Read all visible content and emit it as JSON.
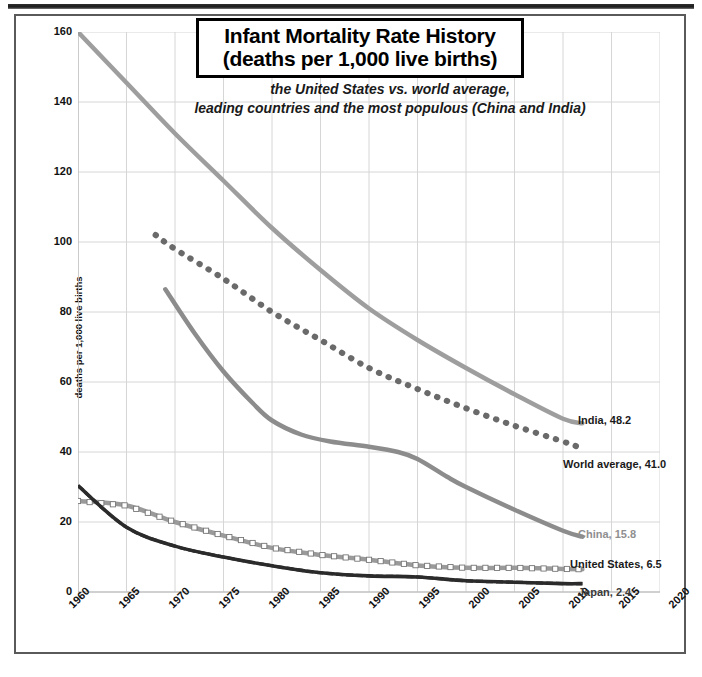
{
  "title": {
    "line1": "Infant Mortality Rate History",
    "line2": "(deaths per 1,000 live births)"
  },
  "subtitle": {
    "line1": "the United States vs. world average,",
    "line2": "leading countries and the most populous (China and India)"
  },
  "chart_data": {
    "type": "line",
    "title": "Infant Mortality Rate History (deaths per 1,000 live births)",
    "subtitle": "the United States vs. world average, leading countries and the most populous (China and India)",
    "xlabel": "",
    "ylabel": "deaths per 1,000 live births",
    "xlim": [
      1960,
      2020
    ],
    "ylim": [
      0,
      160
    ],
    "xticks": [
      1960,
      1965,
      1970,
      1975,
      1980,
      1985,
      1990,
      1995,
      2000,
      2005,
      2010,
      2015,
      2020
    ],
    "yticks": [
      0,
      20,
      40,
      60,
      80,
      100,
      120,
      140,
      160
    ],
    "grid": true,
    "legend_position": "end-of-line labels on right",
    "series": [
      {
        "name": "India",
        "end_label": "India, 48.2",
        "final_value": 48.2,
        "color": "#9e9e9e",
        "style": "solid-thick",
        "x": [
          1960,
          1965,
          1970,
          1975,
          1980,
          1985,
          1990,
          1995,
          2000,
          2005,
          2010,
          2012
        ],
        "values": [
          160.0,
          145.5,
          131.0,
          117.5,
          104.0,
          92.0,
          81.0,
          72.0,
          64.0,
          56.5,
          49.5,
          48.2
        ]
      },
      {
        "name": "World average",
        "end_label": "World average, 41.0",
        "final_value": 41.0,
        "color": "#6a6a6a",
        "style": "dotted",
        "x": [
          1968,
          1970,
          1975,
          1980,
          1985,
          1990,
          1995,
          2000,
          2005,
          2010,
          2012
        ],
        "values": [
          102.0,
          98.0,
          89.5,
          80.0,
          72.0,
          64.0,
          58.0,
          52.5,
          47.5,
          43.0,
          41.0
        ]
      },
      {
        "name": "China",
        "end_label": "China, 15.8",
        "final_value": 15.8,
        "color": "#8c8c8c",
        "style": "solid-thick",
        "x": [
          1969,
          1972,
          1975,
          1978,
          1980,
          1983,
          1986,
          1990,
          1993,
          1995,
          1998,
          2000,
          2005,
          2010,
          2012
        ],
        "values": [
          86.5,
          74.0,
          63.0,
          54.0,
          49.0,
          45.0,
          43.0,
          41.5,
          40.0,
          38.0,
          33.0,
          30.0,
          23.5,
          17.5,
          15.8
        ]
      },
      {
        "name": "United States",
        "end_label": "United States, 6.5",
        "final_value": 6.5,
        "color": "#9a9a9a",
        "style": "solid-marker-square",
        "x": [
          1960,
          1965,
          1970,
          1975,
          1980,
          1985,
          1990,
          1995,
          2000,
          2005,
          2010,
          2012
        ],
        "values": [
          26.0,
          24.7,
          20.0,
          16.1,
          12.6,
          10.6,
          9.2,
          7.6,
          6.9,
          6.9,
          6.6,
          6.5
        ]
      },
      {
        "name": "Japan",
        "end_label": "Japan, 2.4",
        "final_value": 2.4,
        "color": "#2b2b2b",
        "style": "dashed",
        "x": [
          1960,
          1965,
          1970,
          1975,
          1980,
          1985,
          1990,
          1995,
          2000,
          2005,
          2010,
          2012
        ],
        "values": [
          30.4,
          18.5,
          13.1,
          10.0,
          7.5,
          5.5,
          4.6,
          4.3,
          3.2,
          2.8,
          2.4,
          2.4
        ]
      }
    ]
  },
  "yticks_text": [
    "160",
    "140",
    "120",
    "100",
    "80",
    "60",
    "40",
    "20",
    "0"
  ],
  "xticks_text": [
    "1960",
    "1965",
    "1970",
    "1975",
    "1980",
    "1985",
    "1990",
    "1995",
    "2000",
    "2005",
    "2010",
    "2015",
    "2020"
  ],
  "series_labels": {
    "india": "India, 48.2",
    "world": "World average, 41.0",
    "china": "China, 15.8",
    "united_states": "United States, 6.5",
    "japan": "Japan, 2.4"
  },
  "colors": {
    "india": "#9e9e9e",
    "world": "#6a6a6a",
    "china": "#8c8c8c",
    "united_states": "#9a9a9a",
    "japan": "#2b2b2b",
    "grid": "#d6d6d6",
    "axis": "#b5b5b5",
    "title_border": "#000000"
  },
  "axis_label": "deaths per 1,000 live births"
}
